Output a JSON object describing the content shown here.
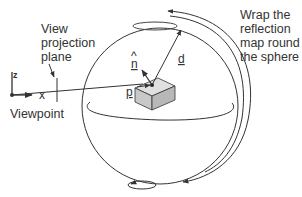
{
  "diagram": {
    "labels": {
      "view_plane": [
        "View",
        "projection",
        "plane"
      ],
      "viewpoint": "Viewpoint",
      "wrap": [
        "Wrap the",
        "reflection",
        "map round",
        "the sphere"
      ],
      "normal": "n",
      "normal_hat": "^",
      "direction": "d",
      "point": "p",
      "axis_x": "x",
      "axis_z": "z"
    },
    "colors": {
      "line": "#333333",
      "object_fill": "#cfcfcf",
      "object_top": "#e2e2e2",
      "object_side": "#bdbdbd"
    }
  }
}
